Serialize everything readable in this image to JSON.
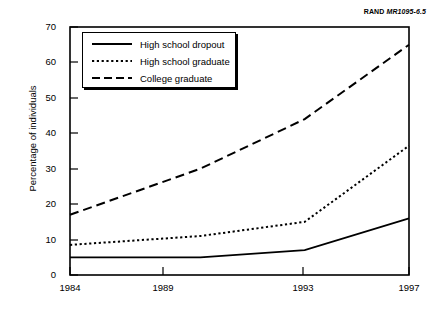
{
  "source_note": {
    "brand": "RAND",
    "document_id": "MR1095-6.5"
  },
  "chart_data": {
    "type": "line",
    "title": "",
    "xlabel": "",
    "ylabel": "Percentage of individuals",
    "x": [
      1984,
      1989,
      1993,
      1997
    ],
    "tick_labels_x": [
      "1984",
      "1989",
      "1993",
      "1997"
    ],
    "tick_labels_y": [
      "0",
      "10",
      "20",
      "30",
      "40",
      "50",
      "60",
      "70"
    ],
    "xlim": [
      1984,
      1997
    ],
    "ylim": [
      0,
      70
    ],
    "yticks": [
      0,
      10,
      20,
      30,
      40,
      50,
      60,
      70
    ],
    "grid": false,
    "legend_position": "upper-left-inset",
    "series": [
      {
        "name": "High school dropout",
        "style": "solid",
        "values": [
          5,
          5,
          7,
          16
        ]
      },
      {
        "name": "High school graduate",
        "style": "dotted",
        "values": [
          8.5,
          11,
          15,
          36.5
        ]
      },
      {
        "name": "College graduate",
        "style": "dashed",
        "values": [
          17,
          30,
          44,
          65
        ]
      }
    ]
  }
}
